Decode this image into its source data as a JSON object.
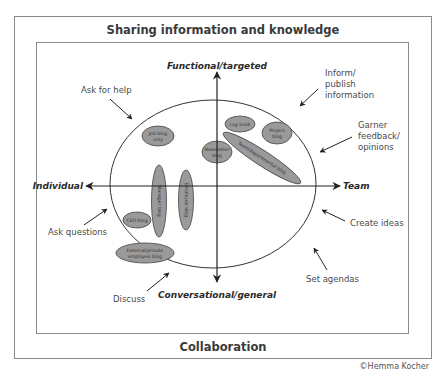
{
  "frames": {
    "outer_title": "Sharing information and knowledge",
    "bottom_title": "Collaboration",
    "credit": "©Hemma Kocher"
  },
  "axes": {
    "top": "Functional/targeted",
    "bottom": "Conversational/general",
    "left": "Individual",
    "right": "Team"
  },
  "annotations": {
    "ask_for_help": "Ask for help",
    "inform_1": "Inform/",
    "inform_2": "publish",
    "inform_3": "information",
    "garner_1": "Garner",
    "garner_2": "feedback/",
    "garner_3": "opinions",
    "create_ideas": "Create ideas",
    "set_agendas": "Set agendas",
    "discuss": "Discuss",
    "ask_questions": "Ask questions"
  },
  "blogs": {
    "job_1": "Job blog",
    "job_2": "only",
    "newsletter_1": "Newsletter",
    "newsletter_2": "blog",
    "log_book": "Log book",
    "project_1": "Project",
    "project_2": "blog",
    "team": "Team/departmental blog",
    "manager": "Manager blog",
    "employee": "Employee blog",
    "ceo": "CEO blog",
    "external_1": "External/private",
    "external_2": "employee blog"
  },
  "colors": {
    "frame": "#8a8a8a",
    "blog_fill": "#9a9a9a",
    "line": "#222222"
  }
}
